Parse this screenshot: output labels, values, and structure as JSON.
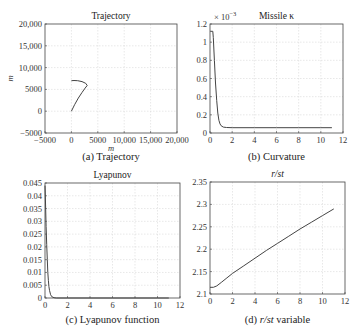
{
  "chart_data": [
    {
      "id": "a",
      "type": "line",
      "title": "Trajectory",
      "caption": "(a) Trajectory",
      "xlabel": "m",
      "ylabel": "m",
      "xlim": [
        -5000,
        20000
      ],
      "ylim": [
        -5000,
        20000
      ],
      "xticks": [
        -5000,
        0,
        5000,
        10000,
        15000,
        20000
      ],
      "xtick_labels": [
        "−5000",
        "0",
        "5000",
        "10,000",
        "15,000",
        "20,000"
      ],
      "yticks": [
        -5000,
        0,
        5000,
        10000,
        15000,
        20000
      ],
      "ytick_labels": [
        "−5000",
        "0",
        "5000",
        "10,000",
        "15,000",
        "20,000"
      ],
      "grid": true,
      "series": [
        {
          "name": "trajectory",
          "x": [
            0,
            600,
            1300,
            2000,
            2600,
            3000,
            2700,
            2000,
            1200,
            500,
            0
          ],
          "y": [
            0,
            1500,
            3000,
            4300,
            5300,
            5900,
            6400,
            6800,
            7000,
            7050,
            7000
          ]
        }
      ]
    },
    {
      "id": "b",
      "type": "line",
      "title": "Missile κ",
      "caption": "(b) Curvature",
      "xlabel": "",
      "ylabel": "",
      "exponent_label": "× 10",
      "exponent_power": "−3",
      "xlim": [
        0,
        12
      ],
      "ylim": [
        0,
        1.2
      ],
      "xticks": [
        0,
        2,
        4,
        6,
        8,
        10,
        12
      ],
      "xtick_labels": [
        "0",
        "2",
        "4",
        "6",
        "8",
        "10",
        "12"
      ],
      "yticks": [
        0,
        0.2,
        0.4,
        0.6,
        0.8,
        1,
        1.2
      ],
      "ytick_labels": [
        "0",
        "0.2",
        "0.4",
        "0.6",
        "0.8",
        "1",
        "1.2"
      ],
      "grid": true,
      "series": [
        {
          "name": "kappa (x1e-3)",
          "x": [
            0,
            0.05,
            0.25,
            0.3,
            0.4,
            0.5,
            0.6,
            0.7,
            0.8,
            0.9,
            1.0,
            1.2,
            1.5,
            2,
            4,
            6,
            8,
            10,
            11
          ],
          "y": [
            1.12,
            1.12,
            1.12,
            1.05,
            0.8,
            0.55,
            0.36,
            0.22,
            0.14,
            0.1,
            0.08,
            0.065,
            0.06,
            0.058,
            0.058,
            0.058,
            0.058,
            0.058,
            0.058
          ]
        }
      ]
    },
    {
      "id": "c",
      "type": "line",
      "title": "Lyapunov",
      "caption": "(c) Lyapunov function",
      "xlabel": "",
      "ylabel": "",
      "xlim": [
        0,
        12
      ],
      "ylim": [
        0,
        0.045
      ],
      "xticks": [
        0,
        2,
        4,
        6,
        8,
        10,
        12
      ],
      "xtick_labels": [
        "0",
        "2",
        "4",
        "6",
        "8",
        "10",
        "12"
      ],
      "yticks": [
        0,
        0.005,
        0.01,
        0.015,
        0.02,
        0.025,
        0.03,
        0.035,
        0.04,
        0.045
      ],
      "ytick_labels": [
        "0",
        "0.005",
        "0.01",
        "0.015",
        "0.02",
        "0.025",
        "0.03",
        "0.035",
        "0.04",
        "0.045"
      ],
      "grid": true,
      "series": [
        {
          "name": "V",
          "x": [
            0,
            0.05,
            0.1,
            0.15,
            0.2,
            0.25,
            0.3,
            0.35,
            0.4,
            0.5,
            0.6,
            0.8,
            1,
            2,
            4,
            6,
            8,
            10,
            11
          ],
          "y": [
            0.044,
            0.036,
            0.028,
            0.021,
            0.015,
            0.01,
            0.0068,
            0.0045,
            0.003,
            0.0013,
            0.0005,
            0.0001,
            0,
            0,
            0,
            0,
            0,
            0,
            0
          ]
        }
      ]
    },
    {
      "id": "d",
      "type": "line",
      "title": "r/st",
      "caption_prefix": "(d) ",
      "caption_italic": "r/st",
      "caption_suffix": " variable",
      "xlabel": "",
      "ylabel": "",
      "xlim": [
        0,
        12
      ],
      "ylim": [
        2.1,
        2.35
      ],
      "xticks": [
        0,
        2,
        4,
        6,
        8,
        10,
        12
      ],
      "xtick_labels": [
        "0",
        "2",
        "4",
        "6",
        "8",
        "10",
        "12"
      ],
      "yticks": [
        2.1,
        2.15,
        2.2,
        2.25,
        2.3,
        2.35
      ],
      "ytick_labels": [
        "2.1",
        "2.15",
        "2.2",
        "2.25",
        "2.3",
        "2.35"
      ],
      "grid": true,
      "series": [
        {
          "name": "r/st",
          "x": [
            0,
            0.3,
            0.6,
            1,
            1.5,
            2,
            3,
            4,
            5,
            6,
            7,
            8,
            9,
            10,
            11
          ],
          "y": [
            2.115,
            2.115,
            2.118,
            2.126,
            2.136,
            2.146,
            2.163,
            2.18,
            2.197,
            2.213,
            2.229,
            2.245,
            2.26,
            2.275,
            2.29
          ]
        }
      ]
    }
  ]
}
